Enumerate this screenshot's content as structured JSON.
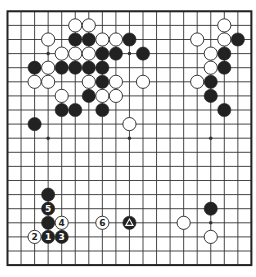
{
  "board": {
    "size": 19,
    "origin_x": 7.5,
    "origin_y": 11.3,
    "step_x": 13.55,
    "step_y": 14.1,
    "line_color": "#333333",
    "border_color": "#222222",
    "background": "#ffffff",
    "stone_radius": 6.6,
    "black_color": "#222222",
    "white_color": "#ffffff",
    "star_points": [
      [
        3,
        3
      ],
      [
        9,
        3
      ],
      [
        3,
        9
      ],
      [
        9,
        9
      ],
      [
        15,
        9
      ],
      [
        15,
        15
      ]
    ]
  },
  "stones": [
    {
      "c": 5,
      "r": 1,
      "color": "white"
    },
    {
      "c": 6,
      "r": 1,
      "color": "white"
    },
    {
      "c": 16,
      "r": 1,
      "color": "white"
    },
    {
      "c": 3,
      "r": 2,
      "color": "white"
    },
    {
      "c": 5,
      "r": 2,
      "color": "black"
    },
    {
      "c": 6,
      "r": 2,
      "color": "black"
    },
    {
      "c": 7,
      "r": 2,
      "color": "white"
    },
    {
      "c": 8,
      "r": 2,
      "color": "white"
    },
    {
      "c": 9,
      "r": 2,
      "color": "black"
    },
    {
      "c": 14,
      "r": 2,
      "color": "white"
    },
    {
      "c": 16,
      "r": 2,
      "color": "white"
    },
    {
      "c": 17,
      "r": 2,
      "color": "black"
    },
    {
      "c": 4,
      "r": 3,
      "color": "white"
    },
    {
      "c": 5,
      "r": 3,
      "color": "white"
    },
    {
      "c": 6,
      "r": 3,
      "color": "white"
    },
    {
      "c": 7,
      "r": 3,
      "color": "black"
    },
    {
      "c": 8,
      "r": 3,
      "color": "black"
    },
    {
      "c": 10,
      "r": 3,
      "color": "black"
    },
    {
      "c": 15,
      "r": 3,
      "color": "white"
    },
    {
      "c": 16,
      "r": 3,
      "color": "black"
    },
    {
      "c": 2,
      "r": 4,
      "color": "black"
    },
    {
      "c": 3,
      "r": 4,
      "color": "white"
    },
    {
      "c": 4,
      "r": 4,
      "color": "black"
    },
    {
      "c": 5,
      "r": 4,
      "color": "black"
    },
    {
      "c": 6,
      "r": 4,
      "color": "black"
    },
    {
      "c": 7,
      "r": 4,
      "color": "black"
    },
    {
      "c": 15,
      "r": 4,
      "color": "white"
    },
    {
      "c": 16,
      "r": 4,
      "color": "black"
    },
    {
      "c": 2,
      "r": 5,
      "color": "white"
    },
    {
      "c": 3,
      "r": 5,
      "color": "white"
    },
    {
      "c": 6,
      "r": 5,
      "color": "white"
    },
    {
      "c": 7,
      "r": 5,
      "color": "black"
    },
    {
      "c": 8,
      "r": 5,
      "color": "white"
    },
    {
      "c": 10,
      "r": 5,
      "color": "white"
    },
    {
      "c": 14,
      "r": 5,
      "color": "white"
    },
    {
      "c": 15,
      "r": 5,
      "color": "black"
    },
    {
      "c": 4,
      "r": 6,
      "color": "white"
    },
    {
      "c": 6,
      "r": 6,
      "color": "black"
    },
    {
      "c": 7,
      "r": 6,
      "color": "white"
    },
    {
      "c": 8,
      "r": 6,
      "color": "white"
    },
    {
      "c": 15,
      "r": 6,
      "color": "black"
    },
    {
      "c": 4,
      "r": 7,
      "color": "black"
    },
    {
      "c": 5,
      "r": 7,
      "color": "black"
    },
    {
      "c": 7,
      "r": 7,
      "color": "black"
    },
    {
      "c": 16,
      "r": 7,
      "color": "black"
    },
    {
      "c": 2,
      "r": 8,
      "color": "black"
    },
    {
      "c": 9,
      "r": 8,
      "color": "white"
    },
    {
      "c": 3,
      "r": 13,
      "color": "black"
    },
    {
      "c": 3,
      "r": 14,
      "color": "black",
      "label": "5"
    },
    {
      "c": 15,
      "r": 14,
      "color": "black"
    },
    {
      "c": 3,
      "r": 15,
      "color": "black"
    },
    {
      "c": 4,
      "r": 15,
      "color": "white",
      "label": "4"
    },
    {
      "c": 7,
      "r": 15,
      "color": "white",
      "label": "6"
    },
    {
      "c": 9,
      "r": 15,
      "color": "black",
      "marker": "triangle"
    },
    {
      "c": 13,
      "r": 15,
      "color": "white"
    },
    {
      "c": 2,
      "r": 16,
      "color": "white",
      "label": "2"
    },
    {
      "c": 3,
      "r": 16,
      "color": "black",
      "label": "1"
    },
    {
      "c": 4,
      "r": 16,
      "color": "black",
      "label": "3"
    },
    {
      "c": 15,
      "r": 16,
      "color": "white"
    }
  ],
  "move_sequence": [
    {
      "move": "1",
      "color": "black",
      "c": 3,
      "r": 16
    },
    {
      "move": "2",
      "color": "white",
      "c": 2,
      "r": 16
    },
    {
      "move": "3",
      "color": "black",
      "c": 4,
      "r": 16
    },
    {
      "move": "4",
      "color": "white",
      "c": 4,
      "r": 15
    },
    {
      "move": "5",
      "color": "black",
      "c": 3,
      "r": 14
    },
    {
      "move": "6",
      "color": "white",
      "c": 7,
      "r": 15
    }
  ],
  "markers": {
    "triangle_stone": {
      "c": 9,
      "r": 15,
      "symbol": "triangle"
    }
  }
}
